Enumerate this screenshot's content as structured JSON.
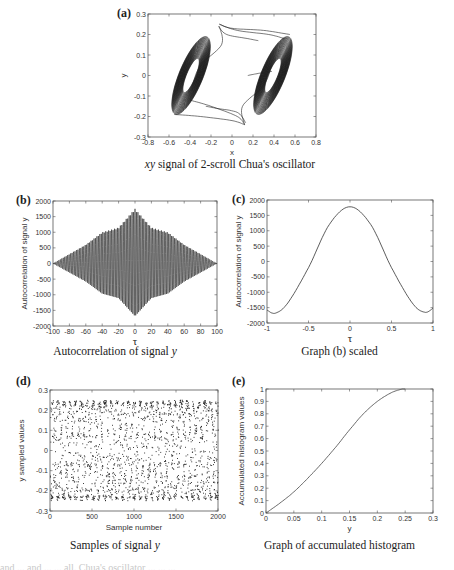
{
  "figure": {
    "panels": {
      "a": {
        "letter": "(a)",
        "caption_italic": "xy",
        "caption_rest": " signal of 2-scroll Chua's oscillator"
      },
      "b": {
        "letter": "(b)",
        "caption_main": "Autocorrelation of signal ",
        "caption_italic": "y"
      },
      "c": {
        "letter": "(c)",
        "caption_main": "Graph (b) scaled"
      },
      "d": {
        "letter": "(d)",
        "caption_main": "Samples of signal ",
        "caption_italic": "y"
      },
      "e": {
        "letter": "(e)",
        "caption_main": "Graph of accumulated histogram"
      }
    },
    "cut_line": "and ... and ... ... all. Chua's oscillator ... ... ..."
  },
  "chart_data": [
    {
      "id": "a",
      "type": "line",
      "title": "xy signal of 2-scroll Chua's oscillator",
      "xlabel": "x",
      "ylabel": "y",
      "xlim": [
        -0.8,
        0.8
      ],
      "ylim": [
        -0.3,
        0.3
      ],
      "xticks": [
        -0.8,
        -0.6,
        -0.4,
        -0.2,
        0,
        0.2,
        0.4,
        0.6,
        0.8
      ],
      "yticks": [
        -0.3,
        -0.2,
        -0.1,
        0,
        0.1,
        0.2,
        0.3
      ],
      "grid": false,
      "description": "Double-scroll attractor: two elliptical scroll bundles centered near (-0.4, 0) and (0.4, 0), tilted, spanning x approx -0.68..-0.1 and 0.1..0.65, y approx -0.24..0.24, connected by transition trajectories"
    },
    {
      "id": "b",
      "type": "line",
      "title": "Autocorrelation of signal y",
      "xlabel": "τ",
      "ylabel": "Autocorrelation of signal y",
      "xlim": [
        -100,
        100
      ],
      "ylim": [
        -2000,
        2000
      ],
      "xticks": [
        -100,
        -80,
        -60,
        -40,
        -20,
        0,
        20,
        40,
        60,
        80,
        100
      ],
      "yticks": [
        -2000,
        -1500,
        -1000,
        -500,
        0,
        500,
        1000,
        1500,
        2000
      ],
      "grid": false,
      "description": "Dense oscillation with diamond-shaped envelope; peak ~1750 at τ=0, trough ~-1700, envelope ~1000 at |τ|=40, decaying to 0 at |τ|=100",
      "envelope": {
        "x": [
          -100,
          -60,
          -40,
          -20,
          0,
          20,
          40,
          60,
          100
        ],
        "upper": [
          0,
          600,
          1000,
          1150,
          1750,
          1150,
          1000,
          600,
          0
        ]
      }
    },
    {
      "id": "c",
      "type": "line",
      "title": "Graph (b) scaled",
      "xlabel": "τ",
      "ylabel": "Autocorrelation of signal y",
      "xlim": [
        -1,
        1
      ],
      "ylim": [
        -2000,
        2000
      ],
      "xticks": [
        -1,
        -0.5,
        0,
        0.5,
        1
      ],
      "yticks": [
        -2000,
        -1500,
        -1000,
        -500,
        0,
        500,
        1000,
        1500,
        2000
      ],
      "grid": false,
      "x": [
        -1,
        -0.9,
        -0.75,
        -0.5,
        -0.25,
        0,
        0.25,
        0.5,
        0.75,
        0.9,
        1
      ],
      "values": [
        -1580,
        -1680,
        -1350,
        -200,
        1200,
        1780,
        1200,
        -200,
        -1350,
        -1650,
        -1520
      ]
    },
    {
      "id": "d",
      "type": "scatter",
      "title": "Samples of signal y",
      "xlabel": "Sample number",
      "ylabel": "y sampled values",
      "xlim": [
        0,
        2000
      ],
      "ylim": [
        -0.3,
        0.3
      ],
      "xticks": [
        0,
        500,
        1000,
        1500,
        2000
      ],
      "yticks": [
        -0.3,
        -0.2,
        -0.1,
        0,
        0.1,
        0.2,
        0.3
      ],
      "grid": false,
      "description": "About 2000 sampled points spread between -0.25 and 0.25, clustered near ±0.1 to ±0.2"
    },
    {
      "id": "e",
      "type": "line",
      "title": "Graph of accumulated histogram",
      "xlabel": "y",
      "ylabel": "Accumulated histogram values",
      "xlim": [
        0,
        0.3
      ],
      "ylim": [
        0,
        1
      ],
      "xticks": [
        0,
        0.05,
        0.1,
        0.15,
        0.2,
        0.25,
        0.3
      ],
      "yticks": [
        0,
        0.1,
        0.2,
        0.3,
        0.4,
        0.5,
        0.6,
        0.7,
        0.8,
        0.9,
        1
      ],
      "grid": false,
      "x": [
        0,
        0.025,
        0.05,
        0.075,
        0.1,
        0.125,
        0.15,
        0.175,
        0.2,
        0.225,
        0.245,
        0.25
      ],
      "values": [
        0,
        0.08,
        0.17,
        0.28,
        0.4,
        0.53,
        0.67,
        0.8,
        0.9,
        0.97,
        1.0,
        1.0
      ]
    }
  ]
}
